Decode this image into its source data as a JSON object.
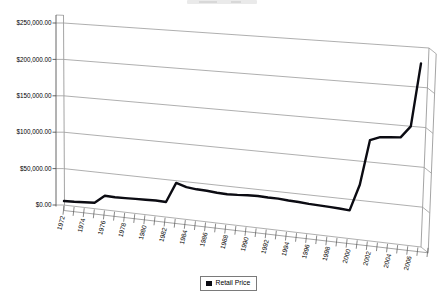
{
  "chart_data": {
    "type": "line",
    "style": "3d-perspective-line",
    "title": "",
    "categories": [
      "1972",
      "1973",
      "1974",
      "1975",
      "1976",
      "1977",
      "1978",
      "1979",
      "1980",
      "1981",
      "1982",
      "1983",
      "1984",
      "1985",
      "1986",
      "1987",
      "1988",
      "1989",
      "1990",
      "1991",
      "1992",
      "1993",
      "1994",
      "1995",
      "1996",
      "1997",
      "1998",
      "1999",
      "2000",
      "2001",
      "2002",
      "2003",
      "2004",
      "2005",
      "2006",
      "2007"
    ],
    "series": [
      {
        "name": "Retail Price",
        "values": [
          5500,
          6000,
          7000,
          8000,
          19000,
          18500,
          19000,
          19500,
          20000,
          20500,
          20000,
          47000,
          43000,
          41500,
          41000,
          40000,
          39500,
          40000,
          41000,
          41500,
          41000,
          41000,
          40000,
          39500,
          38500,
          38000,
          37500,
          37000,
          36000,
          70000,
          128000,
          133000,
          134000,
          135000,
          150000,
          230000
        ]
      }
    ],
    "x_tick_labels": [
      "1972",
      "1974",
      "1976",
      "1978",
      "1980",
      "1982",
      "1984",
      "1986",
      "1988",
      "1990",
      "1992",
      "1994",
      "1996",
      "1998",
      "2000",
      "2002",
      "2004",
      "2006"
    ],
    "y_tick_labels": [
      "$250,000.00",
      "$200,000.00",
      "$150,000.00",
      "$100,000.00",
      "$50,000.00",
      "$0.00"
    ],
    "ylim": [
      0,
      250000
    ],
    "y_tick_interval": 50000,
    "grid": true,
    "legend_position": "bottom",
    "series_color": "#0b0b12",
    "gridline_color": "#9a9a9a",
    "axis_color": "#555555",
    "background_color": "#ffffff"
  },
  "legend": {
    "label": "Retail Price",
    "marker": "filled-square",
    "marker_color": "#0b0b12"
  }
}
